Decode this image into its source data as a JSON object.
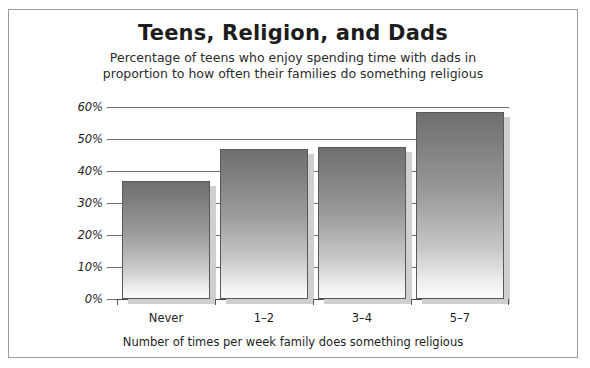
{
  "chart_data": {
    "type": "bar",
    "title": "Teens, Religion, and Dads",
    "subtitle_line_1": "Percentage of teens who enjoy spending time with dads in",
    "subtitle_line_2": "proportion to how often their families do something religious",
    "xlabel": "Number of times per week family does something religious",
    "ylabel": "",
    "categories": [
      "Never",
      "1–2",
      "3–4",
      "5–7"
    ],
    "values": [
      37,
      47,
      47.5,
      58.5
    ],
    "ytick_labels": [
      "60%",
      "50%",
      "40%",
      "30%",
      "20%",
      "10%",
      "0%"
    ],
    "ytick_values": [
      60,
      50,
      40,
      30,
      20,
      10,
      0
    ],
    "ylim": [
      0,
      60
    ],
    "grid": true,
    "legend": "none",
    "series": [
      {
        "name": "Percentage of teens who enjoy spending time with dads",
        "values": [
          37,
          47,
          47.5,
          58.5
        ]
      }
    ],
    "colors": {
      "bar_top": "#6f6f6f",
      "bar_bottom": "#fbfbfb",
      "bar_border": "#585858",
      "bar_shadow": "#cfcfcf",
      "gridline": "#6e6e6e",
      "frame_border": "#9a9a9a",
      "text": "#1d1d1d",
      "background": "#ffffff"
    }
  }
}
